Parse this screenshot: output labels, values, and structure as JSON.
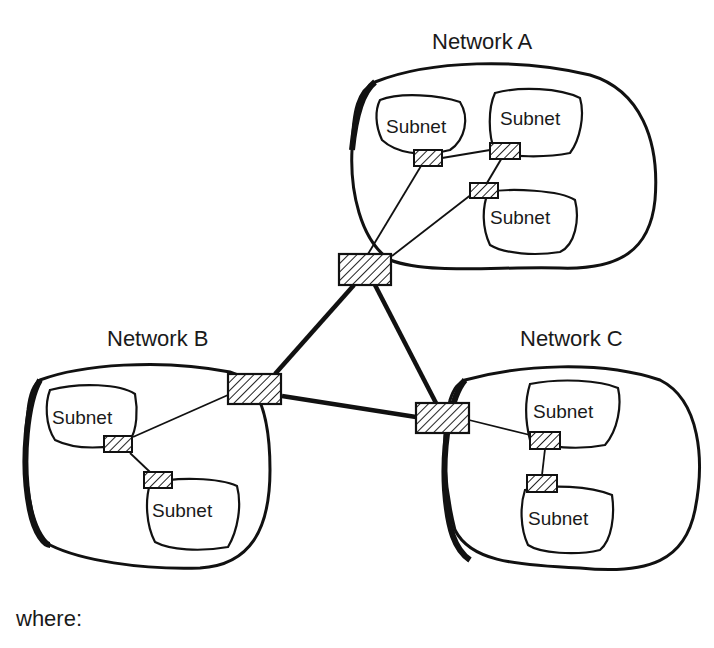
{
  "diagram": {
    "networks": [
      {
        "id": "A",
        "title": "Network A",
        "subnets": [
          "Subnet",
          "Subnet",
          "Subnet"
        ]
      },
      {
        "id": "B",
        "title": "Network B",
        "subnets": [
          "Subnet",
          "Subnet"
        ]
      },
      {
        "id": "C",
        "title": "Network C",
        "subnets": [
          "Subnet",
          "Subnet"
        ]
      }
    ],
    "backbone": {
      "routers": [
        "Router A",
        "Router B",
        "Router C"
      ],
      "links": [
        [
          "A",
          "B"
        ],
        [
          "A",
          "C"
        ],
        [
          "B",
          "C"
        ]
      ]
    },
    "colors": {
      "stroke": "#111111",
      "background": "#ffffff"
    },
    "footer_text": "where:"
  }
}
